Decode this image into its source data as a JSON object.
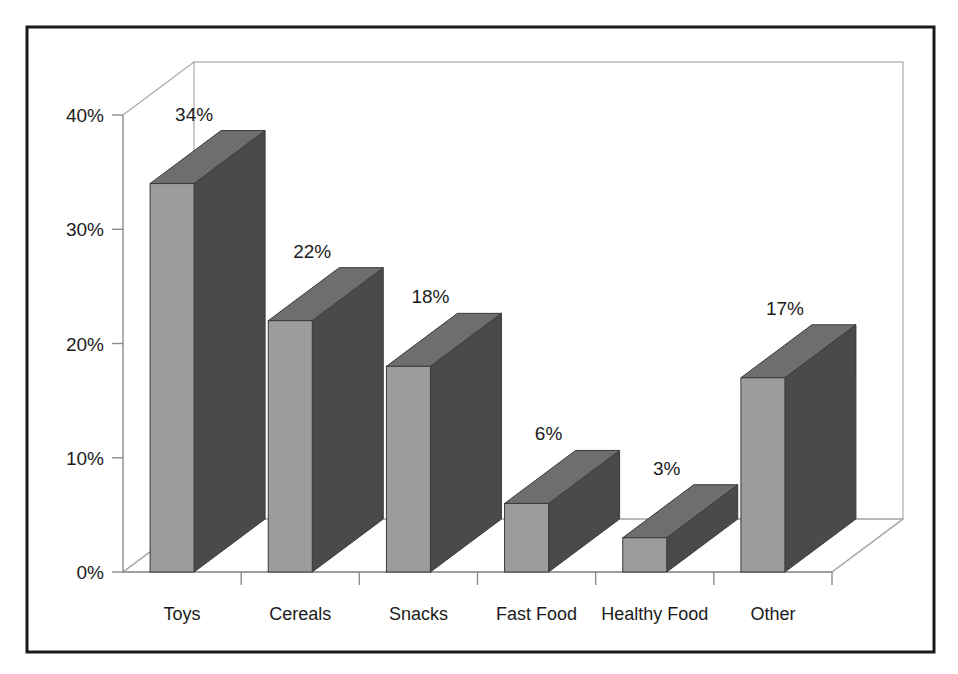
{
  "chart_data": {
    "type": "bar",
    "title": "",
    "subtitle": "",
    "xlabel": "",
    "ylabel": "",
    "categories": [
      "Toys",
      "Cereals",
      "Snacks",
      "Fast Food",
      "Healthy Food",
      "Other"
    ],
    "values": [
      34,
      22,
      18,
      6,
      3,
      17
    ],
    "value_labels": [
      "34%",
      "22%",
      "18%",
      "6%",
      "3%",
      "17%"
    ],
    "ylim": [
      0,
      40
    ],
    "ytick_values": [
      0,
      10,
      20,
      30,
      40
    ],
    "ytick_labels": [
      "0%",
      "10%",
      "20%",
      "30%",
      "40%"
    ],
    "grid": false,
    "legend": "none",
    "style": "3d-column",
    "units": "percent"
  },
  "colors": {
    "frame_border": "#1a1a1a",
    "wall_line": "#a8a8a8",
    "axis_line": "#8c8c8c",
    "bar_front": "#9c9c9c",
    "bar_side": "#4a4a4a",
    "bar_top": "#6e6e6e",
    "bar_outline": "#3a3a3a",
    "text": "#1b1b1b",
    "background": "#ffffff"
  },
  "frame": {
    "label": "chart-frame"
  }
}
